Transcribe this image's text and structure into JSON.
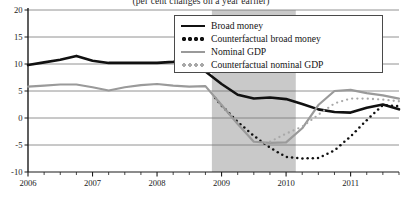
{
  "chart_data": {
    "type": "line",
    "title": "(per cent changes on a year earlier)",
    "xlabel": "",
    "ylabel": "",
    "ylim": [
      -10,
      20
    ],
    "xlim": [
      2006.0,
      2011.75
    ],
    "yticks": [
      "20",
      "15",
      "10",
      "5",
      "0",
      "-5",
      "-10"
    ],
    "ytick_values": [
      20,
      15,
      10,
      5,
      0,
      -5,
      -10
    ],
    "xticks": [
      "2006",
      "2007",
      "2008",
      "2009",
      "2010",
      "2011"
    ],
    "xtick_values": [
      2006,
      2007,
      2008,
      2009,
      2010,
      2011
    ],
    "minor_xticks_per_year": 4,
    "grid": "horizontal",
    "legend_position": "top-right",
    "shaded_region": {
      "label": "",
      "x_start": 2008.85,
      "x_end": 2010.15,
      "color": "#c9c9c9"
    },
    "series": [
      {
        "name": "Broad money",
        "style": "solid",
        "color": "#111111",
        "width": 2.6,
        "x": [
          2006.0,
          2006.25,
          2006.5,
          2006.75,
          2007.0,
          2007.25,
          2007.5,
          2007.75,
          2008.0,
          2008.25,
          2008.5,
          2008.75,
          2009.0,
          2009.25,
          2009.5,
          2009.75,
          2010.0,
          2010.25,
          2010.5,
          2010.75,
          2011.0,
          2011.25,
          2011.5,
          2011.75
        ],
        "y": [
          9.8,
          10.3,
          10.8,
          11.5,
          10.6,
          10.2,
          10.2,
          10.2,
          10.2,
          10.4,
          10.7,
          8.6,
          6.3,
          4.3,
          3.6,
          3.8,
          3.5,
          2.6,
          1.6,
          1.1,
          1.0,
          1.9,
          2.5,
          1.6
        ]
      },
      {
        "name": "Counterfactual broad money",
        "style": "dotted",
        "color": "#111111",
        "width": 2.4,
        "x": [
          2008.9,
          2009.0,
          2009.25,
          2009.5,
          2009.75,
          2010.0,
          2010.25,
          2010.5,
          2010.75,
          2011.0,
          2011.25,
          2011.5,
          2011.75
        ],
        "y": [
          3.7,
          2.3,
          -0.7,
          -3.3,
          -5.5,
          -7.2,
          -7.5,
          -7.4,
          -6.0,
          -3.4,
          -0.4,
          2.4,
          2.2
        ]
      },
      {
        "name": "Nominal GDP",
        "style": "solid",
        "color": "#9a9a9a",
        "width": 2.2,
        "x": [
          2006.0,
          2006.25,
          2006.5,
          2006.75,
          2007.0,
          2007.25,
          2007.5,
          2007.75,
          2008.0,
          2008.25,
          2008.5,
          2008.75,
          2009.0,
          2009.25,
          2009.5,
          2009.75,
          2010.0,
          2010.25,
          2010.5,
          2010.75,
          2011.0,
          2011.25,
          2011.5,
          2011.75
        ],
        "y": [
          5.8,
          6.0,
          6.2,
          6.2,
          5.7,
          5.1,
          5.7,
          6.1,
          6.3,
          6.0,
          5.8,
          5.9,
          2.4,
          -1.1,
          -4.4,
          -4.6,
          -4.5,
          -1.9,
          2.4,
          5.0,
          5.2,
          4.6,
          4.2,
          3.6
        ]
      },
      {
        "name": "Counterfactual nominal GDP",
        "style": "dotted",
        "color": "#a8a8a8",
        "width": 2.2,
        "x": [
          2009.6,
          2009.75,
          2010.0,
          2010.25,
          2010.5,
          2010.75,
          2011.0,
          2011.25,
          2011.5,
          2011.75
        ],
        "y": [
          -5.0,
          -4.4,
          -2.9,
          -1.6,
          0.6,
          2.7,
          3.6,
          3.6,
          3.4,
          3.1
        ]
      }
    ]
  },
  "legend": {
    "items": [
      {
        "label": "Broad money",
        "swatch": "solid-black"
      },
      {
        "label": "Counterfactual broad money",
        "swatch": "dotted-black"
      },
      {
        "label": "Nominal GDP",
        "swatch": "solid-grey"
      },
      {
        "label": "Counterfactual nominal GDP",
        "swatch": "dotted-grey"
      }
    ]
  }
}
